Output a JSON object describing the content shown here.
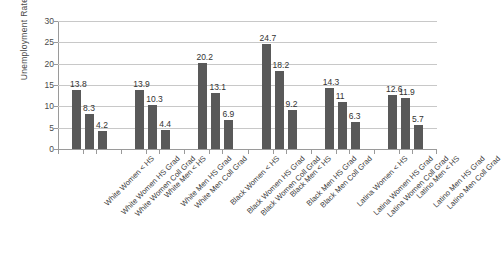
{
  "chart_data": {
    "type": "bar",
    "title": "",
    "xlabel": "",
    "ylabel": "Unemployment Rate",
    "ylim": [
      0,
      30
    ],
    "yticks": [
      0,
      5,
      10,
      15,
      20,
      25,
      30
    ],
    "grid": true,
    "legend": "none",
    "bar_color": "#595959",
    "categories": [
      "White Women < HS",
      "White Women HS Grad",
      "White Women Coll Grad",
      "White Men < HS",
      "White Men HS Grad",
      "White Men Coll Grad",
      "Black Women < HS",
      "Black Women HS Grad",
      "Black Women Coll Grad",
      "Black Men < HS",
      "Black Men HS Grad",
      "Black Men Coll Grad",
      "Latina Women < HS",
      "Latina Women HS Grad",
      "Latina Women Coll Grad",
      "Latino Men < HS",
      "Latino Men HS Grad",
      "Latino Men Coll Grad"
    ],
    "values": [
      13.8,
      8.3,
      4.2,
      13.9,
      10.3,
      4.4,
      20.2,
      13.1,
      6.9,
      24.7,
      18.2,
      9.2,
      14.3,
      11,
      6.3,
      12.6,
      11.9,
      5.7
    ],
    "value_labels": [
      "13.8",
      "8.3",
      "4.2",
      "13.9",
      "10.3",
      "4.4",
      "20.2",
      "13.1",
      "6.9",
      "24.7",
      "18.2",
      "9.2",
      "14.3",
      "11",
      "6.3",
      "12.6",
      "11.9",
      "5.7"
    ],
    "groups": [
      {
        "name": "White Women",
        "indices": [
          0,
          1,
          2
        ]
      },
      {
        "name": "White Men",
        "indices": [
          3,
          4,
          5
        ]
      },
      {
        "name": "Black Women",
        "indices": [
          6,
          7,
          8
        ]
      },
      {
        "name": "Black Men",
        "indices": [
          9,
          10,
          11
        ]
      },
      {
        "name": "Latina Women",
        "indices": [
          12,
          13,
          14
        ]
      },
      {
        "name": "Latino Men",
        "indices": [
          15,
          16,
          17
        ]
      }
    ]
  }
}
